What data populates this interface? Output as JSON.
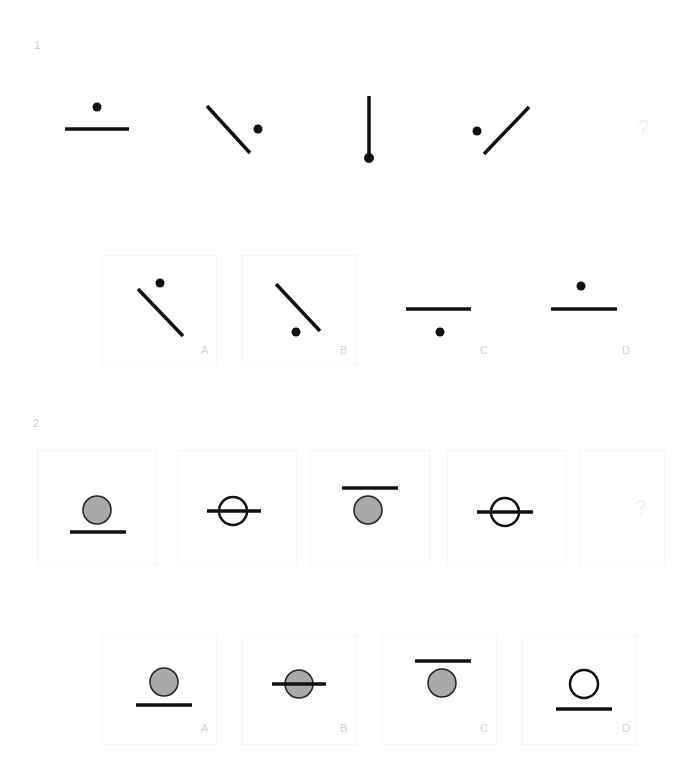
{
  "puzzles": [
    {
      "number": "1",
      "sequence": [
        {
          "id": "fig1",
          "shape": "horizontal line with dot above center"
        },
        {
          "id": "fig2",
          "shape": "diagonal line (\\) with dot to the right"
        },
        {
          "id": "fig3",
          "shape": "vertical line with dot at bottom end"
        },
        {
          "id": "fig4",
          "shape": "diagonal line (/) with dot to the left"
        },
        {
          "id": "fig5",
          "shape": "?"
        }
      ],
      "question_mark": "?",
      "options": [
        {
          "label": "A",
          "shape": "diagonal line (\\) with dot above-right"
        },
        {
          "label": "B",
          "shape": "diagonal line (\\) with dot below-left"
        },
        {
          "label": "C",
          "shape": "horizontal line with dot below"
        },
        {
          "label": "D",
          "shape": "horizontal line with dot above"
        }
      ]
    },
    {
      "number": "2",
      "sequence": [
        {
          "id": "fig1",
          "shape": "gray circle above line"
        },
        {
          "id": "fig2",
          "shape": "white circle crossed by line"
        },
        {
          "id": "fig3",
          "shape": "gray circle below line"
        },
        {
          "id": "fig4",
          "shape": "white circle crossed by line"
        },
        {
          "id": "fig5",
          "shape": "?"
        }
      ],
      "question_mark": "?",
      "options": [
        {
          "label": "A",
          "shape": "gray circle above line"
        },
        {
          "label": "B",
          "shape": "gray circle crossed by line"
        },
        {
          "label": "C",
          "shape": "gray circle below line"
        },
        {
          "label": "D",
          "shape": "white circle above line"
        }
      ]
    }
  ],
  "colors": {
    "ink": "#111111",
    "gray_fill": "#a9a9a9",
    "label": "#d0d0d0"
  }
}
